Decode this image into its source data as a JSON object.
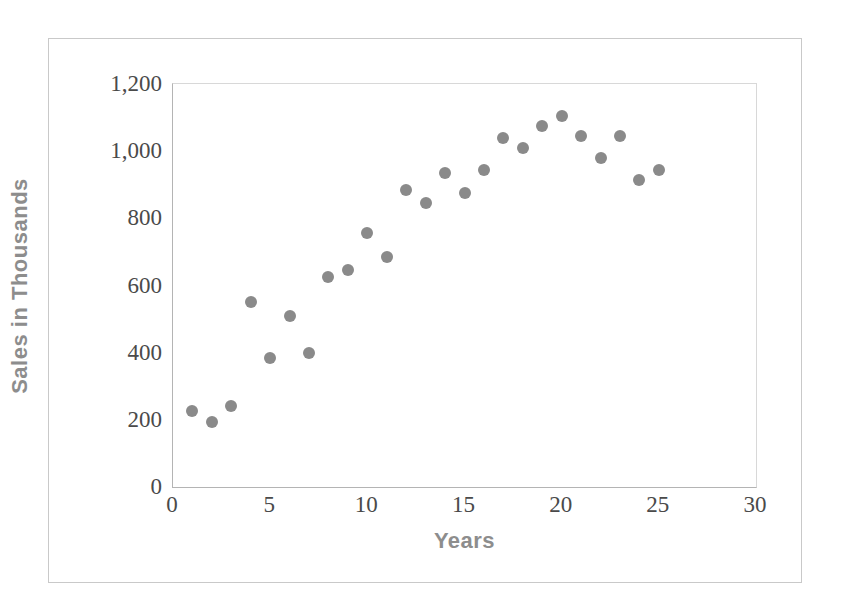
{
  "chart_data": {
    "type": "scatter",
    "title": "",
    "xlabel": "Years",
    "ylabel": "Sales in Thousands",
    "xlim": [
      0,
      30
    ],
    "ylim": [
      0,
      1200
    ],
    "grid": false,
    "legend": null,
    "xticks": [
      "0",
      "5",
      "10",
      "15",
      "20",
      "25",
      "30"
    ],
    "xtick_values": [
      0,
      5,
      10,
      15,
      20,
      25,
      30
    ],
    "yticks": [
      "0",
      "200",
      "400",
      "600",
      "800",
      "1,000",
      "1,200"
    ],
    "ytick_values": [
      0,
      200,
      400,
      600,
      800,
      1000,
      1200
    ],
    "marker_color": "#8a8a8a",
    "marker_size": 12,
    "axis_color": "#b4b4b4",
    "label_color": "#8d8d8d",
    "tick_color": "#4a4a4a",
    "series": [
      {
        "name": "Sales",
        "x": [
          1,
          2,
          3,
          4,
          5,
          6,
          7,
          8,
          9,
          10,
          11,
          12,
          13,
          14,
          15,
          16,
          17,
          18,
          19,
          20,
          21,
          22,
          23,
          24,
          25
        ],
        "y": [
          225,
          195,
          240,
          550,
          385,
          510,
          400,
          625,
          645,
          755,
          685,
          885,
          845,
          935,
          875,
          945,
          1040,
          1010,
          1075,
          1105,
          1045,
          980,
          1045,
          915,
          945
        ]
      }
    ]
  }
}
